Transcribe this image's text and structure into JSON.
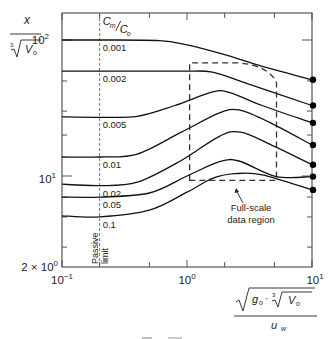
{
  "chart_data": {
    "type": "line",
    "title": "",
    "xscale": "log",
    "yscale": "log",
    "xlim": [
      0.1,
      10
    ],
    "ylim": [
      2,
      160
    ],
    "x_ticks": [
      {
        "value": 0.1,
        "label": "10",
        "exp": "−1"
      },
      {
        "value": 1,
        "label": "10",
        "exp": "0"
      },
      {
        "value": 10,
        "label": "10",
        "exp": "1"
      }
    ],
    "y_ticks": [
      {
        "value": 100,
        "label": "10",
        "exp": "2"
      },
      {
        "value": 10,
        "label": "10",
        "exp": "1"
      },
      {
        "value": 2,
        "label": "2 × 10",
        "exp": "0"
      }
    ],
    "xlabel": {
      "numerator": "√(g₀ · ∛V₀)",
      "numerator_parts": {
        "g": "g",
        "g_sub": "o",
        "v": "V",
        "v_sub": "o",
        "root_index": "3"
      },
      "denominator": "u",
      "denominator_sub": "w"
    },
    "ylabel": {
      "numerator": "x",
      "denominator": "∛V₀",
      "root_index": "3",
      "v": "V",
      "v_sub": "o"
    },
    "legend_title": {
      "num": "C",
      "num_sub": "m",
      "den": "C",
      "den_sub": "o"
    },
    "passive_limit": {
      "x": 0.2,
      "label_line1": "Passive",
      "label_line2": "limit"
    },
    "region": {
      "label_line1": "Full-scale",
      "label_line2": "data region",
      "x": [
        1.05,
        5.2
      ],
      "y": [
        9.3,
        68
      ]
    },
    "series": [
      {
        "name": "0.001",
        "points": [
          [
            0.1,
            100
          ],
          [
            0.2,
            100
          ],
          [
            0.6,
            99
          ],
          [
            1.0,
            92
          ],
          [
            2.0,
            78
          ],
          [
            4.0,
            64
          ],
          [
            10,
            51
          ]
        ]
      },
      {
        "name": "0.002",
        "points": [
          [
            0.1,
            59
          ],
          [
            0.2,
            59
          ],
          [
            0.6,
            59
          ],
          [
            1.0,
            59
          ],
          [
            1.6,
            58
          ],
          [
            3.0,
            48
          ],
          [
            10,
            33
          ]
        ]
      },
      {
        "name": "0.005",
        "points": [
          [
            0.1,
            27.2
          ],
          [
            0.2,
            27
          ],
          [
            0.4,
            27.5
          ],
          [
            0.8,
            33
          ],
          [
            1.6,
            41.5
          ],
          [
            2.2,
            41
          ],
          [
            4.0,
            33
          ],
          [
            10,
            24.6
          ]
        ]
      },
      {
        "name": "0.01",
        "points": [
          [
            0.1,
            13.8
          ],
          [
            0.2,
            13.8
          ],
          [
            0.4,
            14.5
          ],
          [
            0.9,
            21
          ],
          [
            1.8,
            29
          ],
          [
            2.6,
            30.6
          ],
          [
            4.5,
            25
          ],
          [
            10,
            16.9
          ]
        ]
      },
      {
        "name": "0.02",
        "points": [
          [
            0.1,
            8.7
          ],
          [
            0.2,
            8.5
          ],
          [
            0.4,
            9
          ],
          [
            0.9,
            13
          ],
          [
            1.8,
            19.5
          ],
          [
            2.7,
            21
          ],
          [
            5.0,
            16.5
          ],
          [
            10,
            12.1
          ]
        ]
      },
      {
        "name": "0.05",
        "points": [
          [
            0.1,
            7.0
          ],
          [
            0.2,
            7.0
          ],
          [
            0.5,
            7.5
          ],
          [
            1.0,
            10
          ],
          [
            1.8,
            12.7
          ],
          [
            2.6,
            12.9
          ],
          [
            5.2,
            9.9
          ],
          [
            10,
            9.9
          ]
        ]
      },
      {
        "name": "0.1",
        "points": [
          [
            0.1,
            5.1
          ],
          [
            0.2,
            5.0
          ],
          [
            0.5,
            5.6
          ],
          [
            1.0,
            7.6
          ],
          [
            1.6,
            9.6
          ],
          [
            2.4,
            10.4
          ],
          [
            4.0,
            10.2
          ],
          [
            10,
            7.9
          ]
        ]
      }
    ],
    "endpoint_markers": true,
    "grid": false,
    "legend_position": "inline-left"
  },
  "caption": ""
}
